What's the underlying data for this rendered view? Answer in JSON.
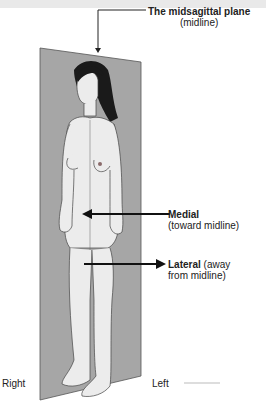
{
  "figure": {
    "title_label": "The midsagittal plane",
    "title_sub": "(midline)",
    "medial_label": "Medial",
    "medial_sub": "(toward midline)",
    "lateral_label": "Lateral",
    "lateral_sub_1": "(away",
    "lateral_sub_2": "from midline)",
    "side_right": "Right",
    "side_left": "Left"
  },
  "colors": {
    "plane": "#a6a6a6",
    "plane_edge": "#555555",
    "skin": "#ececec",
    "hair": "#1a1a1a",
    "line": "#222222"
  }
}
